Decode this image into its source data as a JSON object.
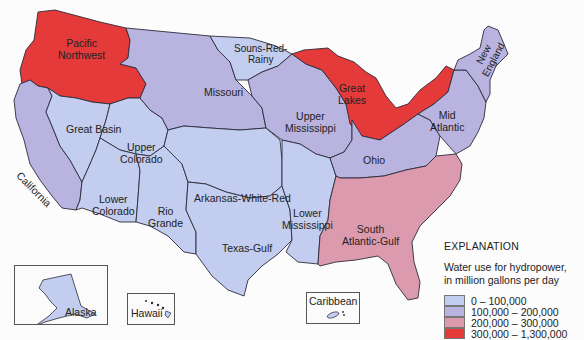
{
  "colors": {
    "low": "#c3cdef",
    "mid_low": "#b9b3e0",
    "mid_high": "#dc9aae",
    "high": "#e53a3a",
    "border": "#2b2b3a",
    "water": "#fcfcfd"
  },
  "regions": [
    {
      "id": "pacific-northwest",
      "label": "Pacific\nNorthwest",
      "class": "high"
    },
    {
      "id": "california",
      "label": "California",
      "class": "mid_low"
    },
    {
      "id": "great-basin",
      "label": "Great Basin",
      "class": "low"
    },
    {
      "id": "upper-colorado",
      "label": "Upper\nColorado",
      "class": "low"
    },
    {
      "id": "lower-colorado",
      "label": "Lower\nColorado",
      "class": "low"
    },
    {
      "id": "rio-grande",
      "label": "Rio\nGrande",
      "class": "low"
    },
    {
      "id": "missouri",
      "label": "Missouri",
      "class": "mid_low"
    },
    {
      "id": "souris-red-rainy",
      "label": "Souns-Red-\nRainy",
      "class": "low"
    },
    {
      "id": "arkansas-white-red",
      "label": "Arkansas-White-Red",
      "class": "low"
    },
    {
      "id": "texas-gulf",
      "label": "Texas-Gulf",
      "class": "low"
    },
    {
      "id": "upper-mississippi",
      "label": "Upper\nMississippi",
      "class": "mid_low"
    },
    {
      "id": "lower-mississippi",
      "label": "Lower\nMississippi",
      "class": "low"
    },
    {
      "id": "great-lakes",
      "label": "Great\nLakes",
      "class": "high"
    },
    {
      "id": "ohio",
      "label": "Ohio",
      "class": "mid_low"
    },
    {
      "id": "mid-atlantic",
      "label": "Mid\nAtlantic",
      "class": "mid_low"
    },
    {
      "id": "new-england",
      "label": "New\nEngland",
      "class": "mid_low"
    },
    {
      "id": "south-atlantic-gulf",
      "label": "South\nAtlantic-Gulf",
      "class": "mid_high"
    }
  ],
  "labels": {
    "pacific_northwest_1": "Pacific",
    "pacific_northwest_2": "Northwest",
    "souris_1": "Souns-Red-",
    "souris_2": "Rainy",
    "missouri": "Missouri",
    "great_lakes_1": "Great",
    "great_lakes_2": "Lakes",
    "new_england_1": "New",
    "new_england_2": "England",
    "great_basin": "Great Basin",
    "upper_colorado_1": "Upper",
    "upper_colorado_2": "Colorado",
    "upper_mississippi_1": "Upper",
    "upper_mississippi_2": "Mississippi",
    "mid_atlantic_1": "Mid",
    "mid_atlantic_2": "Atlantic",
    "california": "California",
    "ohio": "Ohio",
    "lower_colorado_1": "Lower",
    "lower_colorado_2": "Colorado",
    "rio_grande_1": "Rio",
    "rio_grande_2": "Grande",
    "arkansas": "Arkansas-White-Red",
    "lower_mississippi_1": "Lower",
    "lower_mississippi_2": "Mississippi",
    "texas_gulf": "Texas-Gulf",
    "south_atlantic_1": "South",
    "south_atlantic_2": "Atlantic-Gulf"
  },
  "insets": {
    "alaska": "Alaska",
    "hawaii": "Hawaii",
    "caribbean": "Caribbean"
  },
  "legend": {
    "title": "EXPLANATION",
    "subtitle_1": "Water use for hydropower,",
    "subtitle_2": "in million gallons per day",
    "items": [
      {
        "range": "0 – 100,000",
        "color": "#c3cdef"
      },
      {
        "range": "100,000 – 200,000",
        "color": "#b9b3e0"
      },
      {
        "range": "200,000 – 300,000",
        "color": "#dc9aae"
      },
      {
        "range": "300,000 – 1,300,000",
        "color": "#e53a3a"
      }
    ]
  }
}
